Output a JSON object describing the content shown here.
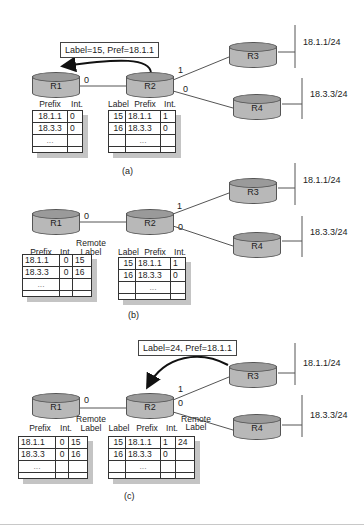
{
  "panels": {
    "a": {
      "caption": "(a)",
      "message": "Label=15, Pref=18.1.1",
      "routers": {
        "r1": "R1",
        "r2": "R2",
        "r3": "R3",
        "r4": "R4"
      },
      "interfaces": {
        "r1_r2": "0",
        "r2_r3": "1",
        "r2_r4": "0"
      },
      "networks": {
        "n1": "18.1.1/24",
        "n2": "18.3.3/24"
      },
      "r1_table": {
        "headers": {
          "prefix": "Prefix",
          "int": "Int."
        },
        "rows": [
          {
            "prefix": "18.1.1",
            "int": "0"
          },
          {
            "prefix": "18.3.3",
            "int": "0"
          },
          {
            "prefix": "...",
            "int": ""
          },
          {
            "prefix": "",
            "int": ""
          }
        ]
      },
      "r2_table": {
        "headers": {
          "label": "Label",
          "prefix": "Prefix",
          "int": "Int."
        },
        "rows": [
          {
            "label": "15",
            "prefix": "18.1.1",
            "int": "1"
          },
          {
            "label": "16",
            "prefix": "18.3.3",
            "int": "0"
          },
          {
            "label": "",
            "prefix": "...",
            "int": ""
          },
          {
            "label": "",
            "prefix": "",
            "int": ""
          }
        ]
      }
    },
    "b": {
      "caption": "(b)",
      "routers": {
        "r1": "R1",
        "r2": "R2",
        "r3": "R3",
        "r4": "R4"
      },
      "interfaces": {
        "r1_r2": "0",
        "r2_r3": "1",
        "r2_r4": "0"
      },
      "networks": {
        "n1": "18.1.1/24",
        "n2": "18.3.3/24"
      },
      "r1_table": {
        "headers": {
          "prefix": "Prefix",
          "int": "Int.",
          "remote_label": "Remote\nLabel",
          "remote": "Remote",
          "label": "Label"
        },
        "rows": [
          {
            "prefix": "18.1.1",
            "int": "0",
            "remote_label": "15"
          },
          {
            "prefix": "18.3.3",
            "int": "0",
            "remote_label": "16"
          },
          {
            "prefix": "...",
            "int": "",
            "remote_label": ""
          },
          {
            "prefix": "",
            "int": "",
            "remote_label": ""
          }
        ]
      },
      "r2_table": {
        "headers": {
          "label": "Label",
          "prefix": "Prefix",
          "int": "Int."
        },
        "rows": [
          {
            "label": "15",
            "prefix": "18.1.1",
            "int": "1"
          },
          {
            "label": "16",
            "prefix": "18.3.3",
            "int": "0"
          },
          {
            "label": "",
            "prefix": "...",
            "int": ""
          },
          {
            "label": "",
            "prefix": "",
            "int": ""
          }
        ]
      }
    },
    "c": {
      "caption": "(c)",
      "message": "Label=24, Pref=18.1.1",
      "routers": {
        "r1": "R1",
        "r2": "R2",
        "r3": "R3",
        "r4": "R4"
      },
      "interfaces": {
        "r1_r2": "0",
        "r2_r3": "1",
        "r2_r4": "0"
      },
      "networks": {
        "n1": "18.1.1/24",
        "n2": "18.3.3/24"
      },
      "r1_table": {
        "headers": {
          "prefix": "Prefix",
          "int": "Int.",
          "remote": "Remote",
          "label": "Label"
        },
        "rows": [
          {
            "prefix": "18.1.1",
            "int": "0",
            "remote_label": "15"
          },
          {
            "prefix": "18.3.3",
            "int": "0",
            "remote_label": "16"
          },
          {
            "prefix": "...",
            "int": "",
            "remote_label": ""
          },
          {
            "prefix": "",
            "int": "",
            "remote_label": ""
          }
        ]
      },
      "r2_table": {
        "headers": {
          "label": "Label",
          "prefix": "Prefix",
          "int": "Int.",
          "remote": "Remote",
          "remote_label": "Label"
        },
        "rows": [
          {
            "label": "15",
            "prefix": "18.1.1",
            "int": "1",
            "remote_label": "24"
          },
          {
            "label": "16",
            "prefix": "18.3.3",
            "int": "0",
            "remote_label": ""
          },
          {
            "label": "",
            "prefix": "...",
            "int": "",
            "remote_label": ""
          },
          {
            "label": "",
            "prefix": "",
            "int": "",
            "remote_label": ""
          }
        ]
      }
    }
  },
  "colors": {
    "router_body": "#b8b8b8",
    "router_top": "#9a9a9a",
    "line": "#555555",
    "table_shadow": "#c4c4c4"
  }
}
